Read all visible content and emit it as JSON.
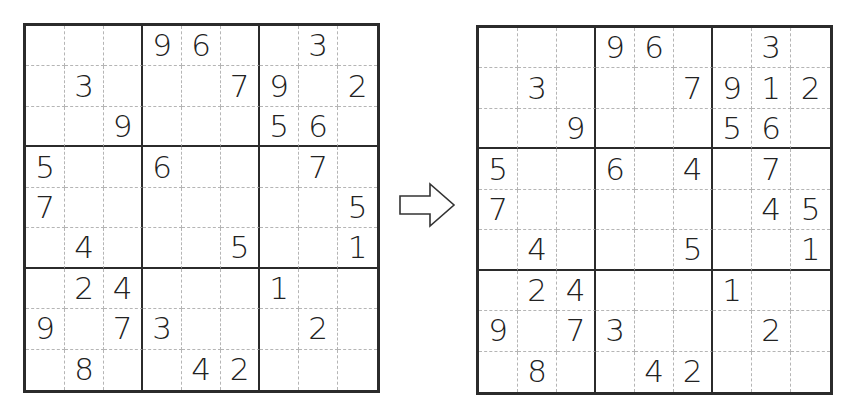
{
  "diagram": {
    "type": "sudoku-before-after",
    "arrow": {
      "direction": "right",
      "icon": "right-arrow-icon"
    },
    "left_grid": {
      "label": "puzzle-initial",
      "rows": [
        [
          "",
          "",
          "",
          "9",
          "6",
          "",
          "",
          "3",
          ""
        ],
        [
          "",
          "3",
          "",
          "",
          "",
          "7",
          "9",
          "",
          "2"
        ],
        [
          "",
          "",
          "9",
          "",
          "",
          "",
          "5",
          "6",
          ""
        ],
        [
          "5",
          "",
          "",
          "6",
          "",
          "",
          "",
          "7",
          ""
        ],
        [
          "7",
          "",
          "",
          "",
          "",
          "",
          "",
          "",
          "5"
        ],
        [
          "",
          "4",
          "",
          "",
          "",
          "5",
          "",
          "",
          "1"
        ],
        [
          "",
          "2",
          "4",
          "",
          "",
          "",
          "1",
          "",
          ""
        ],
        [
          "9",
          "",
          "7",
          "3",
          "",
          "",
          "",
          "2",
          ""
        ],
        [
          "",
          "8",
          "",
          "",
          "4",
          "2",
          "",
          "",
          ""
        ]
      ]
    },
    "right_grid": {
      "label": "puzzle-progressed",
      "rows": [
        [
          "",
          "",
          "",
          "9",
          "6",
          "",
          "",
          "3",
          ""
        ],
        [
          "",
          "3",
          "",
          "",
          "",
          "7",
          "9",
          "1",
          "2"
        ],
        [
          "",
          "",
          "9",
          "",
          "",
          "",
          "5",
          "6",
          ""
        ],
        [
          "5",
          "",
          "",
          "6",
          "",
          "4",
          "",
          "7",
          ""
        ],
        [
          "7",
          "",
          "",
          "",
          "",
          "",
          "",
          "4",
          "5"
        ],
        [
          "",
          "4",
          "",
          "",
          "",
          "5",
          "",
          "",
          "1"
        ],
        [
          "",
          "2",
          "4",
          "",
          "",
          "",
          "1",
          "",
          ""
        ],
        [
          "9",
          "",
          "7",
          "3",
          "",
          "",
          "",
          "2",
          ""
        ],
        [
          "",
          "8",
          "",
          "",
          "4",
          "2",
          "",
          "",
          ""
        ]
      ]
    }
  }
}
